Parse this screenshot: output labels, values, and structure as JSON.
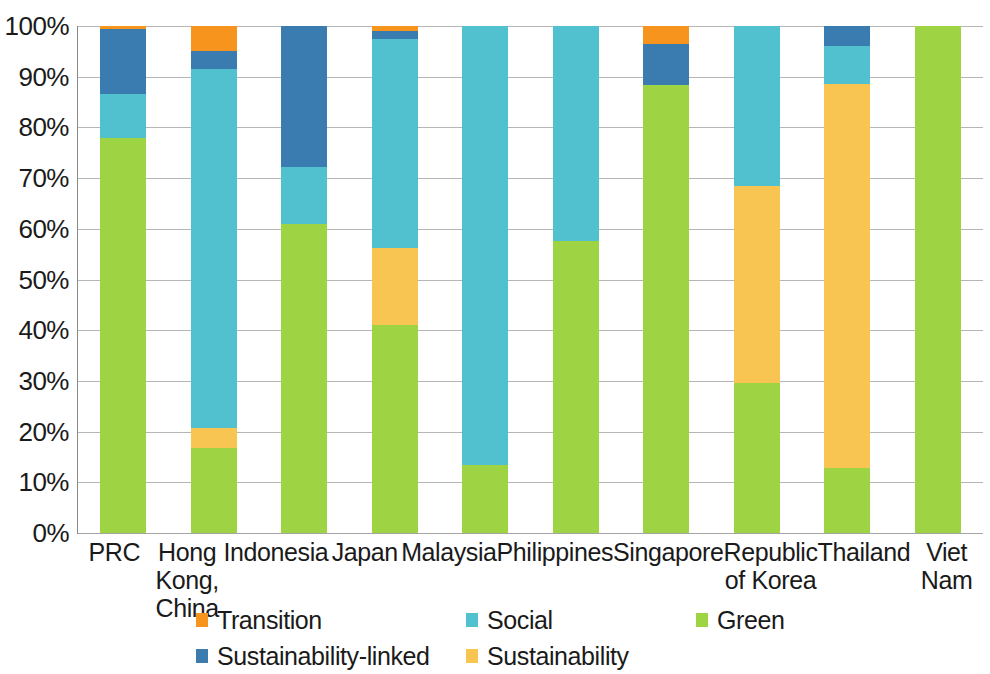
{
  "chart_data": {
    "type": "bar",
    "title": "",
    "subtitle": "",
    "xlabel": "",
    "ylabel": "",
    "stacked": true,
    "normalized": true,
    "ylim": [
      0,
      100
    ],
    "ytick_labels": [
      "100%",
      "90%",
      "80%",
      "70%",
      "60%",
      "50%",
      "40%",
      "30%",
      "20%",
      "10%",
      "0%"
    ],
    "ytick_values": [
      100,
      90,
      80,
      70,
      60,
      50,
      40,
      30,
      20,
      10,
      0
    ],
    "grid": true,
    "legend_position": "bottom",
    "categories": [
      "PRC",
      "Hong Kong,\nChina",
      "Indonesia",
      "Japan",
      "Malaysia",
      "Philippines",
      "Singapore",
      "Republic\nof Korea",
      "Thailand",
      "Viet Nam"
    ],
    "series": [
      {
        "name": "Green",
        "color": "#9ed444",
        "values": [
          78.0,
          16.8,
          61.0,
          41.0,
          13.4,
          57.6,
          88.4,
          29.5,
          12.8,
          100.0
        ]
      },
      {
        "name": "Sustainability",
        "color": "#f9c552",
        "values": [
          0.0,
          4.0,
          0.0,
          15.2,
          0.0,
          0.0,
          0.0,
          39.0,
          75.7,
          0.0
        ]
      },
      {
        "name": "Social",
        "color": "#51c1cf",
        "values": [
          8.6,
          70.7,
          11.1,
          41.3,
          86.6,
          42.4,
          0.0,
          31.5,
          7.5,
          0.0
        ]
      },
      {
        "name": "Sustainability-linked",
        "color": "#3b7cb0",
        "values": [
          12.9,
          3.6,
          27.9,
          1.5,
          0.0,
          0.0,
          8.1,
          0.0,
          4.0,
          0.0
        ]
      },
      {
        "name": "Transition",
        "color": "#f7941e",
        "values": [
          0.5,
          4.9,
          0.0,
          1.0,
          0.0,
          0.0,
          3.5,
          0.0,
          0.0,
          0.0
        ]
      }
    ],
    "legend_order": [
      "Transition",
      "Social",
      "Green",
      "Sustainability-linked",
      "Sustainability"
    ]
  },
  "colors": {
    "transition": "#f7941e",
    "social": "#51c1cf",
    "green": "#9ed444",
    "sustainability_linked": "#3b7cb0",
    "sustainability": "#f9c552",
    "gridline": "#a9a9a9",
    "axis": "#8a8a8a",
    "text": "#1a1a1a",
    "background": "#ffffff"
  }
}
